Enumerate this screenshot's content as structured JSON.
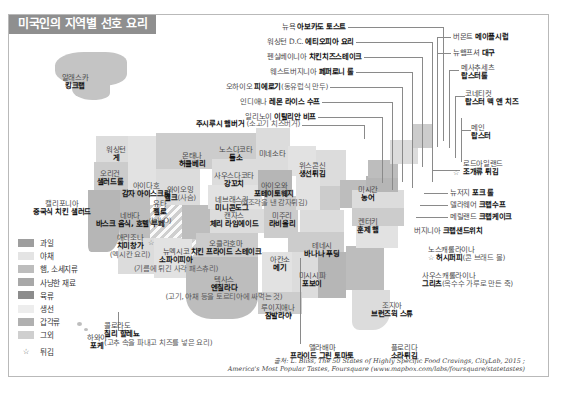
{
  "title": "미국인의 지역별 선호 요리",
  "colors": {
    "title_bar": "#8f8f8f",
    "title_text": "#ffffff",
    "land": "#d4d4d4",
    "leader_line": "#8a8a8a",
    "card_border": "#b9b9b9"
  },
  "legend": {
    "items": [
      {
        "label": "과일",
        "swatch": "#9e9e9e"
      },
      {
        "label": "야채",
        "swatch": "#e4e4e4"
      },
      {
        "label": "햄, 소세지류",
        "swatch": "#bdbdbd"
      },
      {
        "label": "사냥한 재료",
        "swatch": "#a8a8a8"
      },
      {
        "label": "육류",
        "swatch": "#8c8c8c"
      },
      {
        "label": "생선",
        "swatch": "#ededed"
      },
      {
        "label": "갑각류",
        "swatch": "#b0b0b0"
      },
      {
        "label": "그외",
        "swatch": "#cfcfcf"
      }
    ],
    "star": {
      "icon": "star-icon",
      "glyph": "☆",
      "label": "튀김"
    }
  },
  "labels": [
    {
      "state": "알래스카",
      "dish": "킹크랩",
      "note": ""
    },
    {
      "state": "하와이",
      "dish": "포케",
      "note": ""
    },
    {
      "state": "워싱턴",
      "dish": "게",
      "note": ""
    },
    {
      "state": "오리건",
      "dish": "샐러드롤",
      "note": ""
    },
    {
      "state": "캘리포니아",
      "dish": "중국식 치킨 샐러드",
      "note": ""
    },
    {
      "state": "네바다",
      "dish": "바스크 음식, 호텔 부페",
      "note": ""
    },
    {
      "state": "아이다호",
      "dish": "감자 아이스크림",
      "note": ""
    },
    {
      "state": "몬태나",
      "dish": "허클베리",
      "note": ""
    },
    {
      "state": "와이오밍",
      "dish": "엘크",
      "note": "(사슴)"
    },
    {
      "state": "유타",
      "dish": "젤로",
      "note": "(Jell-O)"
    },
    {
      "state": "애리조나",
      "dish": "치미창가",
      "note": "(멕시칸 요리)"
    },
    {
      "state": "뉴멕시코",
      "dish": "소파이피아",
      "note": "(기름에 튀긴 사각 패스츄리)"
    },
    {
      "state": "콜로라도",
      "dish": "칠리 할레뇨",
      "note": "(고추 속을 파내고 치즈를 넣은 요리)"
    },
    {
      "state": "노스다코타",
      "dish": "들소",
      "note": ""
    },
    {
      "state": "사우스다코타",
      "dish": "강꼬치",
      "note": ""
    },
    {
      "state": "네브래스카",
      "dish": "미니콘도그",
      "note": ""
    },
    {
      "state": "캔자스",
      "dish": "체리 라임에이드",
      "note": ""
    },
    {
      "state": "오클라호마",
      "dish": "치킨 프라이드 스테이크",
      "note": ""
    },
    {
      "state": "텍사스",
      "dish": "엔칠라다",
      "note": "(고기, 야채 등을 토르티야에 싸먹는 것)"
    },
    {
      "state": "미네소타",
      "dish": "",
      "note": ""
    },
    {
      "state": "아이오와",
      "dish": "포테이토웨지",
      "note": "(4조각을 낸 감자튀김)"
    },
    {
      "state": "미주리",
      "dish": "라비올리",
      "note": ""
    },
    {
      "state": "아칸소",
      "dish": "메기",
      "note": ""
    },
    {
      "state": "루이지애나",
      "dish": "잠발라야",
      "note": ""
    },
    {
      "state": "미시시피",
      "dish": "포보이",
      "note": ""
    },
    {
      "state": "앨라배마",
      "dish": "프라이드 그린 토마토",
      "note": ""
    },
    {
      "state": "플로리다",
      "dish": "소라튀김",
      "note": ""
    },
    {
      "state": "조지아",
      "dish": "브런즈윅 스튜",
      "note": ""
    },
    {
      "state": "사우스캐롤라이나",
      "dish": "그리츠",
      "note": "(옥수수 가루로 만든 죽)"
    },
    {
      "state": "노스캐롤라이나",
      "dish": "허시퍼피",
      "note": "(콘 브래드 볼)"
    },
    {
      "state": "테네시",
      "dish": "바나나 푸딩",
      "note": ""
    },
    {
      "state": "켄터키",
      "dish": "훈제 햄",
      "note": ""
    },
    {
      "state": "미시간",
      "dish": "농어",
      "note": ""
    },
    {
      "state": "위스콘신",
      "dish": "생선튀김",
      "note": ""
    },
    {
      "state": "주시루시 햄버거",
      "dish": "",
      "note": "(소고기 치즈버거)"
    },
    {
      "state": "오하이오",
      "dish": "피에로기",
      "note": "(동유럽식 만두)"
    },
    {
      "state": "인디애나",
      "dish": "레몬 라이스 수프",
      "note": ""
    },
    {
      "state": "일리노이",
      "dish": "이탈리안 비프",
      "note": ""
    },
    {
      "state": "뉴욕",
      "dish": "아보카도 토스트",
      "note": ""
    },
    {
      "state": "워싱턴 D.C.",
      "dish": "에티오피아 요리",
      "note": ""
    },
    {
      "state": "펜실베이니아",
      "dish": "치킨치즈스테이크",
      "note": ""
    },
    {
      "state": "웨스트버지니아",
      "dish": "페퍼로니 롤",
      "note": ""
    },
    {
      "state": "버몬트",
      "dish": "메이플시럽",
      "note": ""
    },
    {
      "state": "뉴햄프셔",
      "dish": "대구",
      "note": ""
    },
    {
      "state": "메사추세츠",
      "dish": "랍스터롤",
      "note": ""
    },
    {
      "state": "코네티컷",
      "dish": "랍스터 맥 앤 치즈",
      "note": ""
    },
    {
      "state": "메인",
      "dish": "랍스터",
      "note": ""
    },
    {
      "state": "로드아일랜드",
      "dish": "조개류 튀김",
      "note": ""
    },
    {
      "state": "뉴저지",
      "dish": "포크 롤",
      "note": ""
    },
    {
      "state": "델라웨어",
      "dish": "크랩수프",
      "note": ""
    },
    {
      "state": "메릴랜드",
      "dish": "크랩케이크",
      "note": ""
    },
    {
      "state": "버지니아",
      "dish": "크랩샌드위치",
      "note": ""
    }
  ],
  "source": {
    "line1": "출처: L. Bliss, The 50 States of Highly Specific Food Cravings, CityLab, 2015 ;",
    "line2": "America's Most Popular Tastes, Foursquare (www.mapbox.com/labs/foursquare/statetastes)"
  }
}
